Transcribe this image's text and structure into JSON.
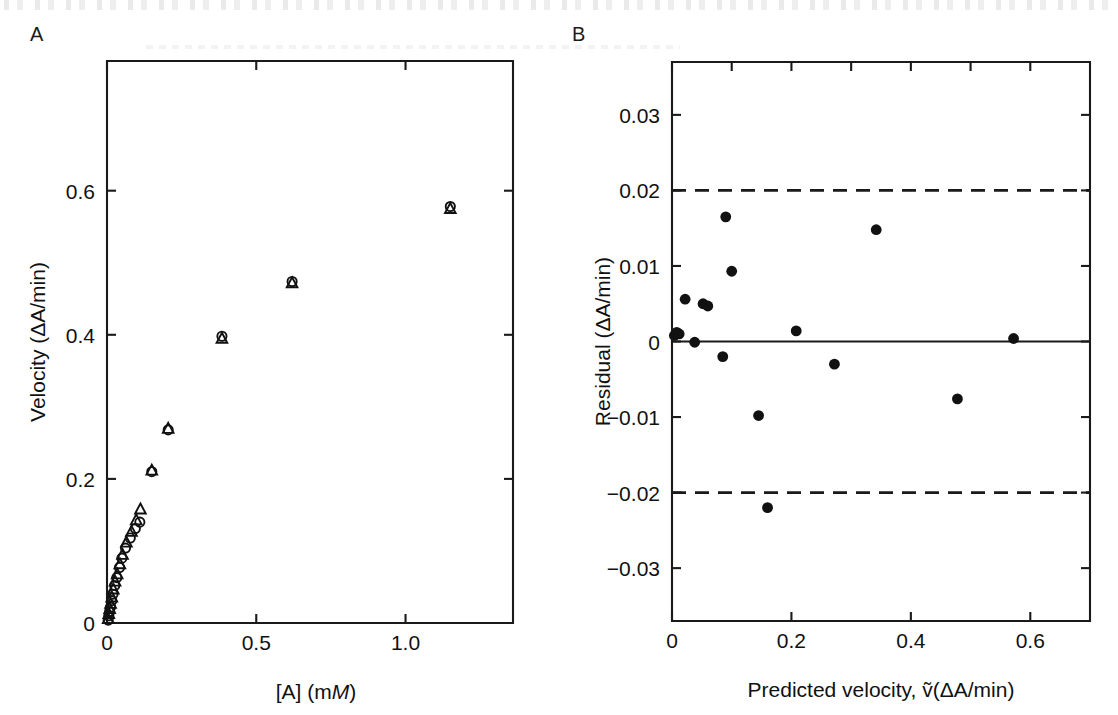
{
  "figure": {
    "panels": [
      {
        "letter": "A",
        "name": "saturation-curve"
      },
      {
        "letter": "B",
        "name": "residual-plot"
      }
    ]
  },
  "chart_data": [
    {
      "type": "scatter",
      "panel": "A",
      "title": "",
      "xlabel": "[A] (mM)",
      "xlabel_parts": [
        "[A] (m",
        "M",
        ")"
      ],
      "ylabel": "Velocity (ΔA/min)",
      "xlim": [
        0,
        1.36
      ],
      "ylim": [
        0,
        0.78
      ],
      "xticks": [
        0,
        0.5,
        1.0
      ],
      "xticklabels": [
        "0",
        "0.5",
        "1.0"
      ],
      "xminorticks": [
        0.25,
        0.75,
        1.25
      ],
      "yticks": [
        0,
        0.2,
        0.4,
        0.6
      ],
      "yticklabels": [
        "0",
        "0.2",
        "0.4",
        "0.6"
      ],
      "grid": false,
      "legend": "none",
      "series": [
        {
          "name": "Replicate 1",
          "marker": "circle-open",
          "points": [
            [
              0.004,
              0.004
            ],
            [
              0.006,
              0.01
            ],
            [
              0.009,
              0.016
            ],
            [
              0.012,
              0.022
            ],
            [
              0.016,
              0.031
            ],
            [
              0.02,
              0.04
            ],
            [
              0.026,
              0.052
            ],
            [
              0.033,
              0.063
            ],
            [
              0.042,
              0.077
            ],
            [
              0.05,
              0.09
            ],
            [
              0.062,
              0.104
            ],
            [
              0.078,
              0.118
            ],
            [
              0.095,
              0.131
            ],
            [
              0.11,
              0.14
            ],
            [
              0.15,
              0.21
            ],
            [
              0.205,
              0.268
            ],
            [
              0.385,
              0.398
            ],
            [
              0.62,
              0.474
            ],
            [
              1.15,
              0.578
            ]
          ]
        },
        {
          "name": "Replicate 2",
          "marker": "triangle-open",
          "points": [
            [
              0.004,
              0.006
            ],
            [
              0.006,
              0.013
            ],
            [
              0.009,
              0.02
            ],
            [
              0.012,
              0.027
            ],
            [
              0.016,
              0.036
            ],
            [
              0.021,
              0.047
            ],
            [
              0.027,
              0.058
            ],
            [
              0.034,
              0.068
            ],
            [
              0.043,
              0.082
            ],
            [
              0.052,
              0.095
            ],
            [
              0.065,
              0.112
            ],
            [
              0.082,
              0.127
            ],
            [
              0.098,
              0.143
            ],
            [
              0.112,
              0.158
            ],
            [
              0.15,
              0.212
            ],
            [
              0.205,
              0.27
            ],
            [
              0.385,
              0.395
            ],
            [
              0.62,
              0.472
            ],
            [
              1.15,
              0.575
            ]
          ]
        }
      ]
    },
    {
      "type": "scatter",
      "panel": "B",
      "title": "",
      "xlabel": "Predicted velocity, ṽ(ΔA/min)",
      "xlabel_parts": [
        "Predicted velocity, ",
        "v̂",
        "(ΔA/min)"
      ],
      "ylabel": "Residual (ΔA/min)",
      "xlim": [
        0,
        0.7
      ],
      "ylim": [
        -0.037,
        0.037
      ],
      "xticks": [
        0,
        0.2,
        0.4,
        0.6
      ],
      "xticklabels": [
        "0",
        "0.2",
        "0.4",
        "0.6"
      ],
      "xminorticks": [
        0.1,
        0.3,
        0.5
      ],
      "yticks": [
        -0.03,
        -0.02,
        -0.01,
        0,
        0.01,
        0.02,
        0.03
      ],
      "yticklabels": [
        "−0.03",
        "−0.02",
        "−0.01",
        "0",
        "0.01",
        "0.02",
        "0.03"
      ],
      "ylabels_shown": [
        "0.03",
        "0.02",
        "0.01",
        "0",
        "−0.01",
        "−0.02",
        "−0.03"
      ],
      "grid": false,
      "legend": "none",
      "reference_lines": [
        {
          "name": "zero-line",
          "y": 0,
          "style": "solid"
        },
        {
          "name": "upper-bound",
          "y": 0.02,
          "style": "dashed"
        },
        {
          "name": "lower-bound",
          "y": -0.02,
          "style": "dashed"
        }
      ],
      "series": [
        {
          "name": "Residuals",
          "marker": "circle-filled",
          "points": [
            [
              0.004,
              0.0008
            ],
            [
              0.008,
              0.0012
            ],
            [
              0.012,
              0.001
            ],
            [
              0.022,
              0.0056
            ],
            [
              0.038,
              -0.0001
            ],
            [
              0.052,
              0.005
            ],
            [
              0.06,
              0.0047
            ],
            [
              0.085,
              -0.002
            ],
            [
              0.09,
              0.0165
            ],
            [
              0.1,
              0.0093
            ],
            [
              0.145,
              -0.0098
            ],
            [
              0.16,
              -0.022
            ],
            [
              0.208,
              0.0014
            ],
            [
              0.272,
              -0.003
            ],
            [
              0.342,
              0.0148
            ],
            [
              0.478,
              -0.0076
            ],
            [
              0.572,
              0.0004
            ]
          ]
        }
      ]
    }
  ]
}
